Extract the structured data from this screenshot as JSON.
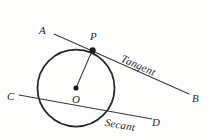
{
  "figure": {
    "kind": "geometry-diagram",
    "background_color": "#fdfdfc",
    "ink_color": "#26262a",
    "stroke_width_circle": 1.7,
    "stroke_width_line": 1.1,
    "circle": {
      "center_label": "O",
      "cx": 76,
      "cy": 88,
      "r": 38.5
    },
    "points": [
      {
        "id": "A",
        "label": "A",
        "x": 55,
        "y": 35
      },
      {
        "id": "P",
        "label": "P",
        "x": 93,
        "y": 50,
        "dot": true,
        "dot_r": 3.1
      },
      {
        "id": "B",
        "label": "B",
        "x": 188,
        "y": 93
      },
      {
        "id": "C",
        "label": "C",
        "x": 20,
        "y": 96
      },
      {
        "id": "D",
        "label": "D",
        "x": 150,
        "y": 119
      },
      {
        "id": "O",
        "label": "O",
        "x": 76,
        "y": 88,
        "dot": true,
        "dot_r": 2.6
      }
    ],
    "lines": [
      {
        "id": "tangent",
        "name": "Tangent",
        "from": "A",
        "to": "B",
        "x1": 54,
        "y1": 34,
        "x2": 189,
        "y2": 94
      },
      {
        "id": "secant",
        "name": "Secant",
        "from": "C",
        "to": "D",
        "x1": 19,
        "y1": 95,
        "x2": 152,
        "y2": 119
      },
      {
        "id": "radius",
        "name": "radius OP",
        "from": "O",
        "to": "P",
        "x1": 76,
        "y1": 88,
        "x2": 92,
        "y2": 51
      }
    ],
    "line_labels": [
      {
        "id": "tangent-label",
        "text": "Tangent",
        "rotation_deg": 24
      },
      {
        "id": "secant-label",
        "text": "Secant",
        "rotation_deg": 10
      }
    ]
  }
}
